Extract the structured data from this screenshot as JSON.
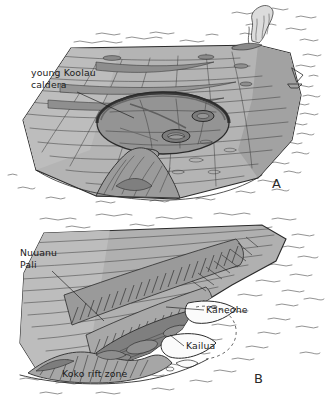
{
  "figure": {
    "panels": [
      {
        "letter": "A",
        "name": "young-koolau-caldera-stage",
        "labels": [
          {
            "id": "caldera",
            "line1": "young Koolau",
            "line2": "caldera"
          }
        ],
        "features": [
          "eruption-plume",
          "summit-caldera",
          "pit-craters",
          "lava-flow-lines",
          "ocean-waves",
          "sailing-boat"
        ]
      },
      {
        "letter": "B",
        "name": "eroded-koolau-range-stage",
        "labels": [
          {
            "id": "nuuanu-pali",
            "line1": "Nuuanu",
            "line2": "Pali"
          },
          {
            "id": "kaneohe",
            "line1": "Kaneohe",
            "line2": ""
          },
          {
            "id": "kailua",
            "line1": "Kailua",
            "line2": ""
          },
          {
            "id": "koko-rift-zone",
            "line1": "Koko  rift  zone",
            "line2": ""
          }
        ],
        "features": [
          "amphitheater-valleys",
          "pali-cliff",
          "kaneohe-bay",
          "kailua-bay",
          "koko-rift-zone",
          "ocean-waves"
        ]
      }
    ],
    "colors": {
      "paper": "#ffffff",
      "ink": "#2b2b2b",
      "land_light": "#b9b9b9",
      "land_mid": "#a3a3a3",
      "land_dark": "#8b8b8b",
      "caldera_fill": "#8e8e8e",
      "lowland_dark": "#7d7d7d",
      "bay_white": "#fcfcfc",
      "plume": "#dcdcdc"
    }
  }
}
